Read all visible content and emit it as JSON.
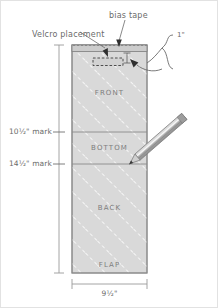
{
  "diagram": {
    "callouts": {
      "bias_tape": "bias tape",
      "velcro": "Velcro placement",
      "one_inch": "1\""
    },
    "marks": [
      {
        "label": "10½\" mark"
      },
      {
        "label": "14½\" mark"
      }
    ],
    "panels": [
      {
        "name": "FRONT"
      },
      {
        "name": "BOTTOM"
      },
      {
        "name": "BACK"
      },
      {
        "name": "FLAP"
      }
    ],
    "dimensions": {
      "width": "9½\""
    },
    "colors": {
      "fabric_fill": "#d9d9d9",
      "fabric_stroke": "#8c8c8c",
      "hatch": "#ffffff",
      "line": "#8a8a8a",
      "text": "#6b6b6b",
      "pencil_body": "#b9b9b9",
      "pencil_dark": "#6e6e6e",
      "background": "#ffffff"
    }
  }
}
